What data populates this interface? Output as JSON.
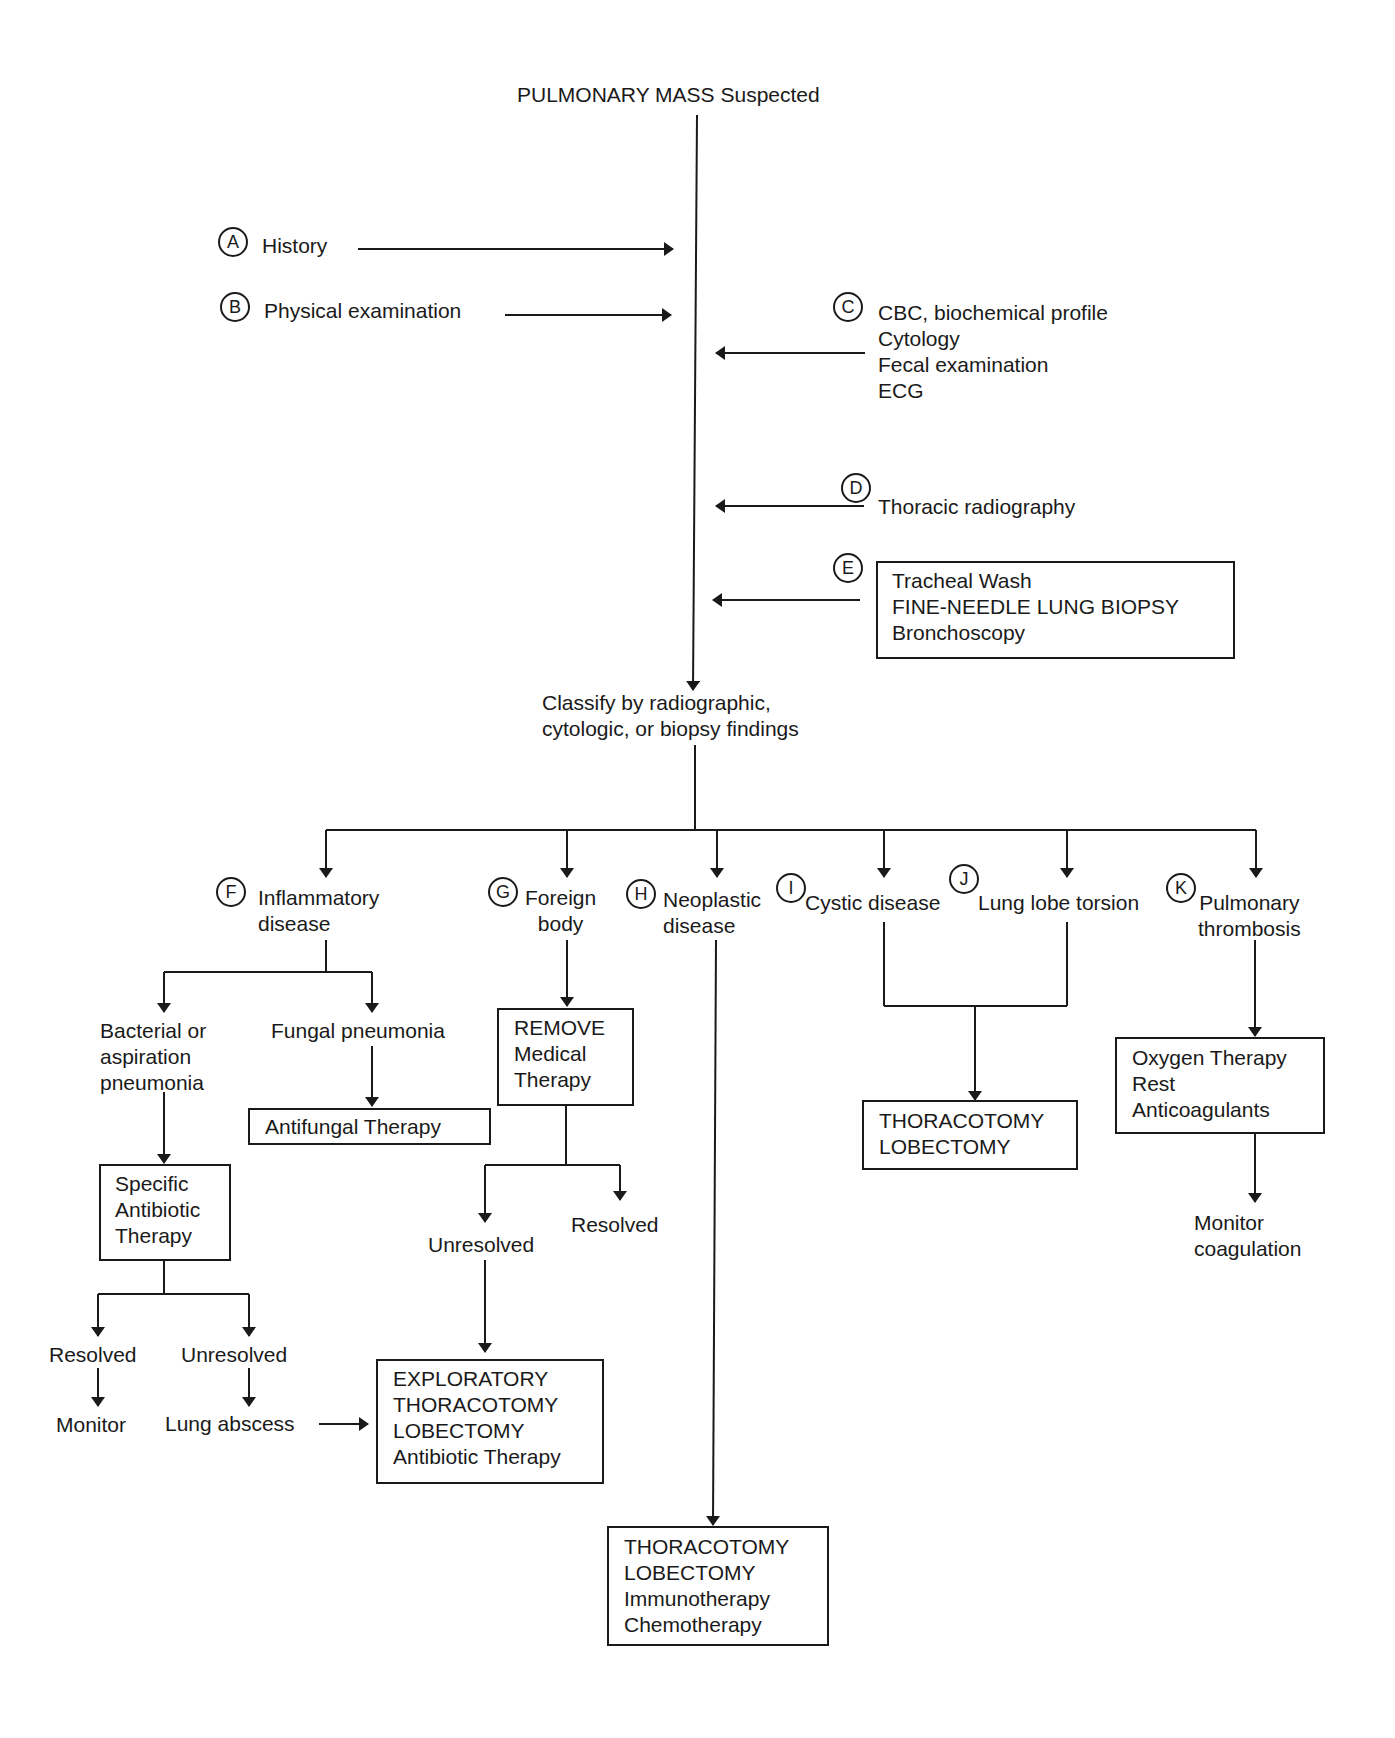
{
  "title": "PULMONARY MASS Suspected",
  "inputs": {
    "A": {
      "letter": "A",
      "label": "History"
    },
    "B": {
      "letter": "B",
      "label": "Physical examination"
    },
    "C": {
      "letter": "C",
      "lines": [
        "CBC, biochemical profile",
        "Cytology",
        "Fecal examination",
        "ECG"
      ]
    },
    "D": {
      "letter": "D",
      "label": "Thoracic radiography"
    },
    "E": {
      "letter": "E",
      "lines": [
        "Tracheal Wash",
        "FINE-NEEDLE LUNG BIOPSY",
        "Bronchoscopy"
      ]
    }
  },
  "classify": [
    "Classify by radiographic,",
    "cytologic, or biopsy findings"
  ],
  "categories": {
    "F": {
      "letter": "F",
      "lines": [
        "Inflammatory",
        "disease"
      ]
    },
    "G": {
      "letter": "G",
      "lines": [
        "Foreign",
        "body"
      ]
    },
    "H": {
      "letter": "H",
      "lines": [
        "Neoplastic",
        "disease"
      ]
    },
    "I": {
      "letter": "I",
      "label": "Cystic disease"
    },
    "J": {
      "letter": "J",
      "label": "Lung lobe torsion"
    },
    "K": {
      "letter": "K",
      "lines": [
        "Pulmonary",
        "thrombosis"
      ]
    }
  },
  "inflammatory": {
    "bacterial": [
      "Bacterial or",
      "aspiration",
      "pneumonia"
    ],
    "fungal": "Fungal pneumonia",
    "antifungal_box": "Antifungal Therapy",
    "antibiotic_box": [
      "Specific",
      "Antibiotic",
      "Therapy"
    ],
    "resolved": "Resolved",
    "unresolved": "Unresolved",
    "monitor": "Monitor",
    "lung_abscess": "Lung abscess"
  },
  "foreign_body": {
    "remove_box": [
      "REMOVE",
      "Medical",
      "Therapy"
    ],
    "unresolved": "Unresolved",
    "resolved": "Resolved",
    "exploratory_box": [
      "EXPLORATORY",
      "THORACOTOMY",
      "LOBECTOMY",
      "Antibiotic Therapy"
    ]
  },
  "neoplastic": {
    "box": [
      "THORACOTOMY",
      "LOBECTOMY",
      "Immunotherapy",
      "Chemotherapy"
    ]
  },
  "cystic_torsion": {
    "box": [
      "THORACOTOMY",
      "LOBECTOMY"
    ]
  },
  "thrombosis": {
    "box": [
      "Oxygen Therapy",
      "Rest",
      "Anticoagulants"
    ],
    "monitor": [
      "Monitor",
      "coagulation"
    ]
  }
}
